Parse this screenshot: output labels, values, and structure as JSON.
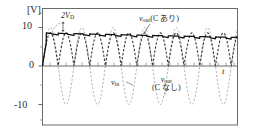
{
  "figure": {
    "axis": {
      "unit_label": "[V]",
      "x_axis_label": "t",
      "y_ticks": [
        "10",
        "0",
        "-10"
      ],
      "y_tick_values": [
        10,
        0,
        -10
      ],
      "ylim": [
        -13.5,
        12.5
      ],
      "xlim": [
        0,
        6.35
      ],
      "frame_color": "#5a5a5a",
      "grid": false
    },
    "annotations": {
      "peak_drop": "2V",
      "peak_drop_sub": "D",
      "vout_with_c_main": "v",
      "vout_with_c_sub": "out",
      "vout_with_c_paren": "(C あり)",
      "vin_main": "v",
      "vin_sub": "in",
      "vout_no_c_main": "v",
      "vout_no_c_sub": "out",
      "vout_no_c_paren": "(C なし)"
    }
  },
  "chart_data": {
    "type": "line",
    "title": "",
    "xlabel": "t",
    "ylabel": "[V]",
    "ylim": [
      -13.5,
      12.5
    ],
    "xlim": [
      0,
      6.35
    ],
    "yticks": [
      10,
      0,
      -10
    ],
    "grid": false,
    "legend": "inline-annotations",
    "series": [
      {
        "name": "v_in",
        "style": "dashed",
        "color": "#9a9a9a",
        "description": "Input sine wave, amplitude 10 V, about 6.2 cycles across the axis",
        "amplitude": 10,
        "cycles": 6.2,
        "phase_deg": 0
      },
      {
        "name": "v_out (C なし)",
        "style": "dashed",
        "color": "#3a3a3a",
        "description": "Full-wave rectified sine without smoothing capacitor, peak about 8.6 V (input peak minus 2V_D)",
        "peak": 8.6,
        "cycles": 12.4
      },
      {
        "name": "v_out (C あり)",
        "style": "solid",
        "color": "#111111",
        "description": "Smoothed output with capacitor: rises to about 8.6 V then small sawtooth ripple slowly decaying to about 7.4 V",
        "peak_start": 8.6,
        "peak_end": 7.4,
        "ripple_peak_to_peak": 0.45,
        "ripple_count": 12
      }
    ],
    "annotations": [
      {
        "text": "2V_D",
        "x": 0.55,
        "y": 10.3,
        "note": "arrow to gap between input peak and rectified peak"
      },
      {
        "text": "v_out (C あり)",
        "x": 3.7,
        "y": 11.2
      },
      {
        "text": "v_in",
        "x": 2.6,
        "y": -3.2
      },
      {
        "text": "v_out (C なし)",
        "x": 4.4,
        "y": -3.6
      }
    ]
  }
}
